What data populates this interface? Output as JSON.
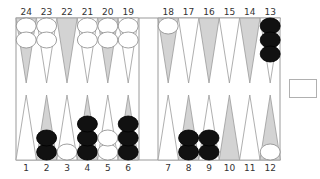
{
  "colors": {
    "board_bg": "#ffffff",
    "border": "#9a9a9a",
    "point_light": "#ffffff",
    "point_dark": "#d3d3d3",
    "point_outline": "#9a9a9a",
    "black_checker": "#111111",
    "white_checker": "#ffffff",
    "white_checker_outline": "#888888",
    "label": "#333333"
  },
  "labels": {
    "top": [
      "24",
      "23",
      "22",
      "21",
      "20",
      "19",
      "18",
      "17",
      "16",
      "15",
      "14",
      "13"
    ],
    "bottom": [
      "1",
      "2",
      "3",
      "4",
      "5",
      "6",
      "7",
      "8",
      "9",
      "10",
      "11",
      "12"
    ]
  },
  "points": [
    {
      "n": 1,
      "row": "bottom",
      "shade": "light",
      "checkers": 0,
      "color": null
    },
    {
      "n": 2,
      "row": "bottom",
      "shade": "dark",
      "checkers": 2,
      "color": "black"
    },
    {
      "n": 3,
      "row": "bottom",
      "shade": "light",
      "checkers": 1,
      "color": "white"
    },
    {
      "n": 4,
      "row": "bottom",
      "shade": "dark",
      "checkers": 3,
      "color": "black"
    },
    {
      "n": 5,
      "row": "bottom",
      "shade": "light",
      "checkers": 2,
      "color": "white"
    },
    {
      "n": 6,
      "row": "bottom",
      "shade": "dark",
      "checkers": 3,
      "color": "black"
    },
    {
      "n": 7,
      "row": "bottom",
      "shade": "light",
      "checkers": 0,
      "color": null
    },
    {
      "n": 8,
      "row": "bottom",
      "shade": "dark",
      "checkers": 2,
      "color": "black"
    },
    {
      "n": 9,
      "row": "bottom",
      "shade": "light",
      "checkers": 2,
      "color": "black"
    },
    {
      "n": 10,
      "row": "bottom",
      "shade": "dark",
      "checkers": 0,
      "color": null
    },
    {
      "n": 11,
      "row": "bottom",
      "shade": "light",
      "checkers": 0,
      "color": null
    },
    {
      "n": 12,
      "row": "bottom",
      "shade": "dark",
      "checkers": 1,
      "color": "white"
    },
    {
      "n": 13,
      "row": "top",
      "shade": "light",
      "checkers": 3,
      "color": "black"
    },
    {
      "n": 14,
      "row": "top",
      "shade": "dark",
      "checkers": 0,
      "color": null
    },
    {
      "n": 15,
      "row": "top",
      "shade": "light",
      "checkers": 0,
      "color": null
    },
    {
      "n": 16,
      "row": "top",
      "shade": "dark",
      "checkers": 0,
      "color": null
    },
    {
      "n": 17,
      "row": "top",
      "shade": "light",
      "checkers": 0,
      "color": null
    },
    {
      "n": 18,
      "row": "top",
      "shade": "dark",
      "checkers": 1,
      "color": "white"
    },
    {
      "n": 19,
      "row": "top",
      "shade": "light",
      "checkers": 2,
      "color": "white"
    },
    {
      "n": 20,
      "row": "top",
      "shade": "dark",
      "checkers": 2,
      "color": "white"
    },
    {
      "n": 21,
      "row": "top",
      "shade": "light",
      "checkers": 2,
      "color": "white"
    },
    {
      "n": 22,
      "row": "top",
      "shade": "dark",
      "checkers": 0,
      "color": null
    },
    {
      "n": 23,
      "row": "top",
      "shade": "light",
      "checkers": 2,
      "color": "white"
    },
    {
      "n": 24,
      "row": "top",
      "shade": "dark",
      "checkers": 2,
      "color": "white"
    }
  ],
  "cube": {
    "value": ""
  }
}
